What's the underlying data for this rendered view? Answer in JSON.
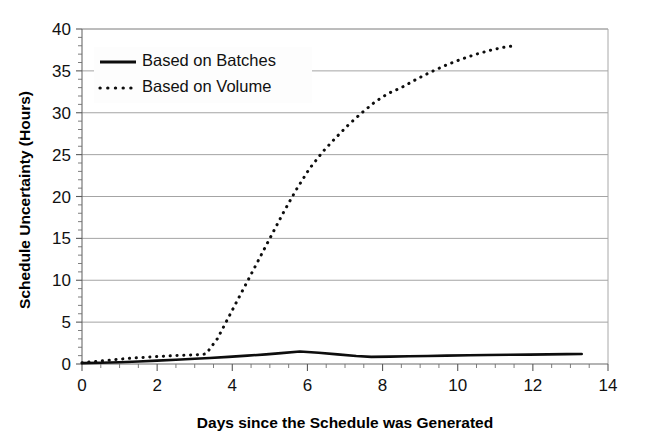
{
  "chart_data": {
    "type": "line",
    "title": "",
    "xlabel": "Days since the Schedule was Generated",
    "ylabel": "Schedule Uncertainty (Hours)",
    "xlim": [
      0,
      14
    ],
    "ylim": [
      0,
      40
    ],
    "xticks": [
      0,
      2,
      4,
      6,
      8,
      10,
      12,
      14
    ],
    "yticks": [
      0,
      5,
      10,
      15,
      20,
      25,
      30,
      35,
      40
    ],
    "xtick_labels": [
      "0",
      "2",
      "4",
      "6",
      "8",
      "10",
      "12",
      "14"
    ],
    "ytick_labels": [
      "0",
      "5",
      "10",
      "15",
      "20",
      "25",
      "30",
      "35",
      "40"
    ],
    "x_minor_step": 0.5,
    "y_minor_step": 1,
    "grid": "horizontal-major",
    "legend_position": "upper-left-inside",
    "line_color": "#0d0d0d",
    "grid_color": "#9a9a9a",
    "background": "#ffffff",
    "series": [
      {
        "name": "Based on Batches",
        "style": "solid",
        "x": [
          0.0,
          0.5,
          1.0,
          1.5,
          2.0,
          2.5,
          3.0,
          3.4,
          3.9,
          4.4,
          4.9,
          5.3,
          5.8,
          6.3,
          6.8,
          7.3,
          7.7,
          8.2,
          8.7,
          9.2,
          9.7,
          10.3,
          10.8,
          11.4,
          11.9,
          12.4,
          12.9,
          13.3
        ],
        "y": [
          0.1,
          0.15,
          0.2,
          0.3,
          0.4,
          0.5,
          0.62,
          0.72,
          0.85,
          1.0,
          1.15,
          1.3,
          1.5,
          1.35,
          1.15,
          0.95,
          0.85,
          0.88,
          0.92,
          0.96,
          1.0,
          1.04,
          1.08,
          1.1,
          1.12,
          1.15,
          1.18,
          1.2
        ]
      },
      {
        "name": "Based on Volume",
        "style": "dotted",
        "x": [
          0.0,
          0.35,
          0.7,
          1.05,
          1.4,
          1.75,
          2.1,
          2.45,
          2.75,
          3.05,
          3.3,
          3.6,
          3.95,
          4.3,
          4.65,
          5.0,
          5.35,
          5.7,
          6.05,
          6.4,
          6.75,
          7.1,
          7.45,
          7.8,
          8.15,
          8.5,
          8.9,
          9.3,
          9.7,
          10.1,
          10.5,
          10.9,
          11.2,
          11.5
        ],
        "y": [
          0.15,
          0.3,
          0.45,
          0.6,
          0.72,
          0.82,
          0.92,
          1.0,
          1.05,
          1.1,
          1.2,
          3.0,
          6.0,
          9.0,
          12.0,
          15.0,
          18.0,
          20.8,
          23.3,
          25.3,
          27.0,
          28.6,
          30.0,
          31.3,
          32.3,
          33.0,
          34.0,
          34.9,
          35.7,
          36.4,
          37.0,
          37.5,
          37.8,
          38.0
        ]
      }
    ]
  },
  "legend": {
    "items": [
      {
        "label": "Based on Batches",
        "style": "solid"
      },
      {
        "label": "Based on Volume",
        "style": "dotted"
      }
    ]
  }
}
